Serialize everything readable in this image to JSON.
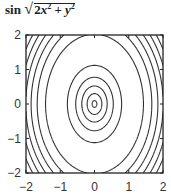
{
  "chart_data": {
    "type": "contour",
    "function": "sin(sqrt(2*x^2 + y^2))",
    "xlabel": "",
    "ylabel": "",
    "xlim": [
      -2,
      2
    ],
    "ylim": [
      -2,
      2
    ],
    "x_ticks": [
      "-2",
      "-1",
      "0",
      "1",
      "2"
    ],
    "y_ticks": [
      "-2",
      "-1",
      "0",
      "1",
      "2"
    ],
    "contour_levels": [
      -0.9,
      -0.7,
      -0.5,
      -0.3,
      -0.1,
      0.1,
      0.3,
      0.5,
      0.7,
      0.9
    ],
    "grid": false,
    "legend": false,
    "line_color": "#333333"
  },
  "title": {
    "prefix": "sin",
    "radicand_a": "2",
    "var_x": "x",
    "exp": "2",
    "plus": " + ",
    "var_y": "y"
  }
}
